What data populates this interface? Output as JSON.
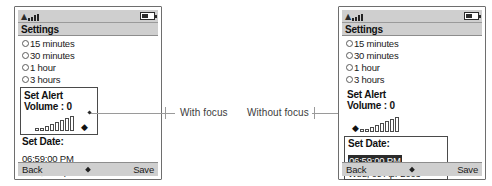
{
  "figure": {
    "annotations": [
      {
        "id": "with-focus",
        "label": "With focus"
      },
      {
        "id": "without-focus",
        "label": "Without focus"
      }
    ]
  },
  "phones": [
    {
      "id": "left",
      "variant": "with-focus",
      "statusbar": {
        "signal_icon": "signal-bars-icon",
        "battery_icon": "battery-icon"
      },
      "title": "Settings",
      "options": [
        {
          "label": "15 minutes",
          "selected": false
        },
        {
          "label": "30 minutes",
          "selected": false
        },
        {
          "label": "1 hour",
          "selected": false
        },
        {
          "label": "3 hours",
          "selected": false
        }
      ],
      "alert": {
        "line1": "Set Alert",
        "line2": "Volume : 0",
        "value": 0,
        "focused": true,
        "bar_heights": [
          3,
          3,
          5,
          7,
          9,
          11,
          13,
          15
        ]
      },
      "date": {
        "title": "Set Date:",
        "time": "06:59:00 PM",
        "day": "Wed, 09 Apr 2003",
        "focused": false,
        "time_selected": false
      },
      "softkeys": {
        "left": "Back",
        "right": "Save",
        "center_icon": "diamond-icon"
      }
    },
    {
      "id": "right",
      "variant": "without-focus",
      "statusbar": {
        "signal_icon": "signal-bars-icon",
        "battery_icon": "battery-icon"
      },
      "title": "Settings",
      "options": [
        {
          "label": "15 minutes",
          "selected": false
        },
        {
          "label": "30 minutes",
          "selected": false
        },
        {
          "label": "1 hour",
          "selected": false
        },
        {
          "label": "3 hours",
          "selected": false
        }
      ],
      "alert": {
        "line1": "Set Alert",
        "line2": "Volume : 0",
        "value": 0,
        "focused": false,
        "bar_heights": [
          3,
          3,
          5,
          7,
          9,
          11,
          13,
          15
        ]
      },
      "date": {
        "title": "Set Date:",
        "time": "06:59:00 PM",
        "day": "Wed, 09 Apr 2003",
        "focused": true,
        "time_selected": true
      },
      "softkeys": {
        "left": "Back",
        "right": "Save",
        "center_icon": "diamond-icon"
      }
    }
  ],
  "colors": {
    "chrome": "#cfcfcf",
    "outline": "#6e6e6e",
    "focus_border": "#4a4a4a",
    "selection_bg": "#2b2b2b",
    "selection_fg": "#ffffff",
    "leader_line": "#9a9a9a"
  }
}
